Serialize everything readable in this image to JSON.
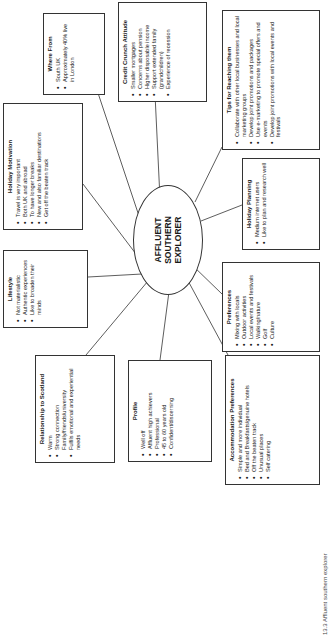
{
  "center": {
    "lines": [
      "AFFLUENT",
      "SOUTHERN",
      "EXPLORER"
    ]
  },
  "boxes": {
    "where_from": {
      "title": "Where From",
      "items": [
        "South UK",
        "Approximately 40% live in London"
      ]
    },
    "credit_crunch": {
      "title": "Credit Crunch Attitude",
      "items": [
        "Smaller mortgages",
        "Concerns about pension",
        "Higher disposable income",
        "Support extended family (grandchildren)",
        "Experience of recession"
      ]
    },
    "tips": {
      "title": "Tips for Reaching them",
      "items": [
        "Collaborate with other local businesses and local marketing groups",
        "Develop joint promotions and packages",
        "Use e-marketing to promote special offers and events",
        "Develop joint promotions with local events and festivals"
      ]
    },
    "holiday_motivation": {
      "title": "Holiday Motivation",
      "items": [
        "Travel is very important",
        "Both UK and abroad",
        "To have longer breaks",
        "New and also familiar destinations",
        "Get off the beaten track"
      ]
    },
    "holiday_planning": {
      "title": "Holiday Planning",
      "items": [
        "Medium internet users",
        "Like to plan and research well"
      ]
    },
    "lifestyle": {
      "title": "Lifestyle",
      "items": [
        "Not materialistic",
        "Authentic experiences",
        "Like to broaden their minds"
      ]
    },
    "preferences": {
      "title": "Preferences",
      "items": [
        "Mixing with locals",
        "Outdoor activities",
        "Local events and festivals",
        "Walking/nature",
        "Golf",
        "Culture"
      ]
    },
    "relationship": {
      "title": "Relationship to Scotland",
      "items": [
        "Warm",
        "Strong connection Family/friends/university",
        "Fulfils emotional and experiential needs"
      ]
    },
    "profile": {
      "title": "Profile",
      "items": [
        "Well off",
        "Affluent high achievers",
        "Professional",
        "45 to 60 years old",
        "Confident/discerning"
      ]
    },
    "accommodation": {
      "title": "Accommodation Preferences",
      "items": [
        "Simple and more individual",
        "Bed and Breakfasts/genuine hotels",
        "Off the beaten track",
        "Unusual places",
        "Self catering"
      ]
    }
  },
  "caption": "13.3 Affluent southern explorer"
}
